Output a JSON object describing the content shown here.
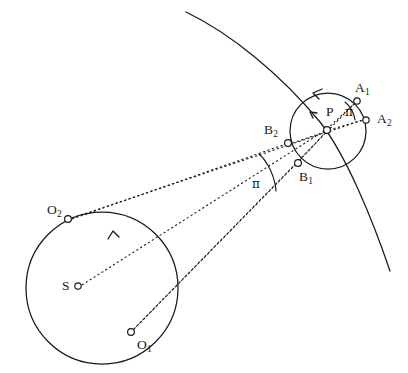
{
  "figure": {
    "type": "geometry-diagram",
    "title": "",
    "background_color": "#ffffff",
    "stroke_color": "#1a1a1a",
    "width": 408,
    "height": 373,
    "labels": {
      "point_S": "S",
      "point_O1": "O",
      "point_O1_sub": "1",
      "point_O2": "O",
      "point_O2_sub": "2",
      "point_A1": "A",
      "point_A1_sub": "1",
      "point_A2": "A",
      "point_A2_sub": "2",
      "point_B1": "B",
      "point_B1_sub": "1",
      "point_B2": "B",
      "point_B2_sub": "2",
      "point_P": "P",
      "angle_pi_left": "π",
      "angle_pi_right": "π"
    },
    "elements": {
      "large_circle": {
        "cx": 102,
        "cy": 288,
        "r": 76
      },
      "small_circle": {
        "cx": 328,
        "cy": 131,
        "r": 38
      },
      "big_arc": "large background arc sweeping from upper-left to lower-right",
      "markers": [
        {
          "name": "S",
          "cx": 78,
          "cy": 286,
          "r": 3.2
        },
        {
          "name": "O2",
          "cx": 68,
          "cy": 219,
          "r": 3.4
        },
        {
          "name": "O1",
          "cx": 131,
          "cy": 332,
          "r": 3.4
        },
        {
          "name": "P",
          "cx": 327,
          "cy": 130,
          "r": 3.4
        },
        {
          "name": "A1",
          "cx": 357,
          "cy": 101,
          "r": 3.2
        },
        {
          "name": "A2",
          "cx": 366,
          "cy": 120,
          "r": 3.2
        },
        {
          "name": "B2",
          "cx": 288,
          "cy": 143,
          "r": 3.4
        },
        {
          "name": "B1",
          "cx": 298,
          "cy": 163,
          "r": 3.4
        }
      ],
      "dashed_lines": [
        {
          "from": "S",
          "to": "P"
        },
        {
          "from": "O2",
          "to": "A2"
        },
        {
          "from": "O2",
          "to": "B2"
        },
        {
          "from": "O1",
          "to": "A1"
        },
        {
          "from": "O1",
          "to": "B1"
        }
      ],
      "direction_arrows": [
        {
          "on": "small_circle",
          "sense": "counterclockwise"
        },
        {
          "on": "large_circle",
          "sense": "counterclockwise"
        }
      ],
      "angle_arcs": [
        {
          "label": "π",
          "vertex_region": "between O2 and O1 sight-lines",
          "x": 256,
          "y": 184
        },
        {
          "label": "π",
          "vertex_region": "between A1 and A2 at P",
          "x": 349,
          "y": 112
        }
      ]
    }
  }
}
